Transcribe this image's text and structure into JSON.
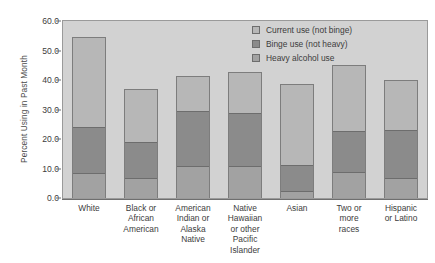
{
  "chart_data": {
    "type": "bar",
    "title": "",
    "subtitle": "",
    "xlabel": "",
    "ylabel": "Percent Using in Past Month",
    "ylim": [
      0.0,
      60.0
    ],
    "ytick_labels": [
      "0.0",
      "10.0",
      "20.0",
      "30.0",
      "40.0",
      "50.0",
      "60.0"
    ],
    "ytick_values": [
      0.0,
      10.0,
      20.0,
      30.0,
      40.0,
      50.0,
      60.0
    ],
    "grid": false,
    "stacked": true,
    "legend_position": "top-right",
    "categories": [
      "White",
      "Black or African American",
      "American Indian or Alaska Native",
      "Native Hawaiian or other Pacific Islander",
      "Asian",
      "Two or more races",
      "Hispanic or Latino"
    ],
    "category_lines": [
      [
        "White"
      ],
      [
        "Black or",
        "African",
        "American"
      ],
      [
        "American",
        "Indian or",
        "Alaska",
        "Native"
      ],
      [
        "Native",
        "Hawaiian",
        "or other",
        "Pacific",
        "Islander"
      ],
      [
        "Asian"
      ],
      [
        "Two or",
        "more",
        "races"
      ],
      [
        "Hispanic",
        "or Latino"
      ]
    ],
    "series": [
      {
        "name": "Heavy alcohol use",
        "color": "#a2a2a2",
        "values": [
          8.6,
          6.7,
          11.0,
          10.9,
          2.5,
          9.0,
          7.0
        ]
      },
      {
        "name": "Binge use (not heavy)",
        "color": "#8b8b8b",
        "values": [
          15.7,
          12.6,
          18.6,
          18.1,
          8.7,
          13.9,
          16.2
        ]
      },
      {
        "name": "Current use (not binge)",
        "color": "#b7b7b7",
        "values": [
          30.3,
          17.8,
          11.9,
          13.6,
          27.3,
          22.1,
          16.8
        ]
      }
    ],
    "totals": [
      54.6,
      37.1,
      41.5,
      42.6,
      38.5,
      45.0,
      40.0
    ],
    "cumulative_tops": {
      "heavy": [
        8.6,
        6.7,
        11.0,
        10.9,
        2.5,
        9.0,
        7.0
      ],
      "binge": [
        24.3,
        19.3,
        29.6,
        29.0,
        11.2,
        22.9,
        23.2
      ],
      "current": [
        54.6,
        37.1,
        41.5,
        42.6,
        38.5,
        45.0,
        40.0
      ]
    }
  },
  "legend": {
    "entries": [
      {
        "label": "Current use (not binge)",
        "color": "#b7b7b7"
      },
      {
        "label": "Binge use (not heavy)",
        "color": "#8b8b8b"
      },
      {
        "label": "Heavy alcohol use",
        "color": "#a2a2a2"
      }
    ]
  },
  "colors": {
    "plot_background": "#d2d2d2",
    "figure_background": "#ffffff",
    "axis": "#6f6f6f",
    "bar_outline": "#7d7d7d",
    "text": "#3c3c3c"
  }
}
